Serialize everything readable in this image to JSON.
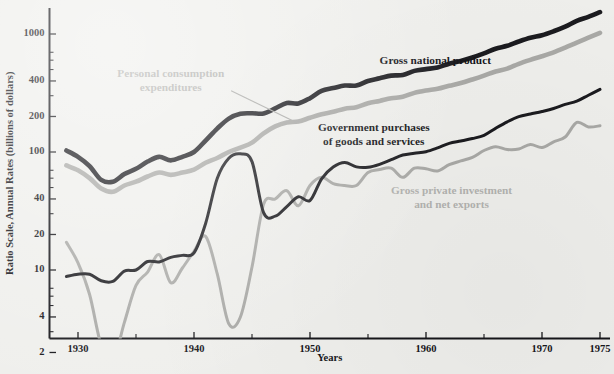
{
  "chart_data": {
    "type": "line",
    "title": "",
    "xlabel": "Years",
    "ylabel": "Ratio Scale, Annual Rates (billions of dollars)",
    "yscale": "log",
    "ylim": [
      2,
      1700
    ],
    "xlim": [
      1929,
      1976
    ],
    "grid": false,
    "legend_position": "inline-annotations",
    "ytick_labels": [
      "1000",
      "400",
      "200",
      "100",
      "40",
      "20",
      "10",
      "4",
      "2"
    ],
    "ytick_values": [
      1000,
      400,
      200,
      100,
      40,
      20,
      10,
      4,
      2
    ],
    "yminor_values": [
      700,
      600,
      500,
      300,
      70,
      60,
      50,
      30,
      7,
      6,
      5,
      3
    ],
    "xtick_labels": [
      "1930",
      "1940",
      "1950",
      "1960",
      "1970",
      "1975"
    ],
    "xtick_values": [
      1930,
      1940,
      1950,
      1960,
      1970,
      1975
    ],
    "xminor_values": [
      1935,
      1945,
      1955,
      1965
    ],
    "colors": {
      "dark_series": "#1b1b1f",
      "gray_series": "#a9a9a6",
      "background": "#efefec",
      "axis": "#16161a",
      "dark_label": "#141418",
      "gray_label": "#b3b3b0"
    },
    "series": [
      {
        "name": "Gross national product",
        "color_key": "dark_series",
        "stroke_width": 4.6,
        "label": {
          "text_lines": [
            "Gross national product"
          ],
          "x": 1956.0,
          "y": 560,
          "anchor": "start"
        },
        "x": [
          1929,
          1930,
          1931,
          1932,
          1933,
          1934,
          1935,
          1936,
          1937,
          1938,
          1939,
          1940,
          1941,
          1942,
          1943,
          1944,
          1945,
          1946,
          1947,
          1948,
          1949,
          1950,
          1951,
          1952,
          1953,
          1954,
          1955,
          1956,
          1957,
          1958,
          1959,
          1960,
          1961,
          1962,
          1963,
          1964,
          1965,
          1966,
          1967,
          1968,
          1969,
          1970,
          1971,
          1972,
          1973,
          1974,
          1975
        ],
        "y": [
          103,
          91,
          76,
          58,
          56,
          65,
          72,
          83,
          91,
          85,
          91,
          100,
          125,
          158,
          192,
          211,
          213,
          212,
          234,
          260,
          258,
          286,
          330,
          348,
          366,
          366,
          400,
          421,
          444,
          449,
          487,
          504,
          521,
          560,
          591,
          632,
          685,
          750,
          794,
          864,
          930,
          977,
          1055,
          1155,
          1294,
          1397,
          1530
        ]
      },
      {
        "name": "Personal consumption expenditures",
        "color_key": "gray_series",
        "stroke_width": 4.6,
        "label": {
          "text_lines": [
            "Personal consumption",
            "expenditures"
          ],
          "x": 1938.0,
          "y": 430,
          "anchor": "middle"
        },
        "leader": {
          "x1": 1943.2,
          "y1": 330,
          "x2": 1948.6,
          "y2": 182
        },
        "x": [
          1929,
          1930,
          1931,
          1932,
          1933,
          1934,
          1935,
          1936,
          1937,
          1938,
          1939,
          1940,
          1941,
          1942,
          1943,
          1944,
          1945,
          1946,
          1947,
          1948,
          1949,
          1950,
          1951,
          1952,
          1953,
          1954,
          1955,
          1956,
          1957,
          1958,
          1959,
          1960,
          1961,
          1962,
          1963,
          1964,
          1965,
          1966,
          1967,
          1968,
          1969,
          1970,
          1971,
          1972,
          1973,
          1974,
          1975
        ],
        "y": [
          77,
          70,
          60,
          49,
          46,
          52,
          56,
          62,
          67,
          64,
          67,
          71,
          81,
          89,
          100,
          109,
          120,
          144,
          165,
          178,
          181,
          195,
          209,
          219,
          233,
          240,
          259,
          271,
          285,
          294,
          317,
          332,
          343,
          364,
          384,
          412,
          444,
          481,
          509,
          559,
          604,
          648,
          700,
          768,
          847,
          932,
          1024
        ]
      },
      {
        "name": "Government purchases of goods and services",
        "color_key": "dark_series",
        "stroke_width": 3.0,
        "label": {
          "text_lines": [
            "Government purchases",
            "of goods and services"
          ],
          "x": 1955.5,
          "y": 150,
          "anchor": "middle"
        },
        "x": [
          1929,
          1930,
          1931,
          1932,
          1933,
          1934,
          1935,
          1936,
          1937,
          1938,
          1939,
          1940,
          1941,
          1942,
          1943,
          1944,
          1945,
          1946,
          1947,
          1948,
          1949,
          1950,
          1951,
          1952,
          1953,
          1954,
          1955,
          1956,
          1957,
          1958,
          1959,
          1960,
          1961,
          1962,
          1963,
          1964,
          1965,
          1966,
          1967,
          1968,
          1969,
          1970,
          1971,
          1972,
          1973,
          1974,
          1975
        ],
        "y": [
          8.8,
          9.2,
          9.2,
          8.1,
          8.0,
          9.8,
          10.0,
          11.8,
          11.7,
          12.8,
          13.3,
          14.0,
          24.8,
          59.6,
          88.6,
          96.5,
          82.9,
          30.6,
          28.6,
          34.5,
          41.8,
          38.8,
          59.3,
          74.7,
          81.6,
          74.8,
          74.2,
          78.6,
          86.1,
          94.2,
          97.6,
          100.6,
          108.3,
          118.2,
          123.8,
          130.0,
          138.4,
          158.7,
          180.1,
          199.6,
          210.0,
          220.5,
          233.7,
          253.1,
          269.5,
          302.7,
          339.0
        ]
      },
      {
        "name": "Gross private investment and net exports",
        "color_key": "gray_series",
        "stroke_width": 3.0,
        "label": {
          "text_lines": [
            "Gross private investment",
            "and net exports"
          ],
          "x": 1962.2,
          "y": 44,
          "anchor": "middle"
        },
        "x": [
          1929,
          1930,
          1931,
          1932,
          1933,
          1934,
          1935,
          1936,
          1937,
          1938,
          1939,
          1940,
          1941,
          1942,
          1943,
          1944,
          1945,
          1946,
          1947,
          1948,
          1949,
          1950,
          1951,
          1952,
          1953,
          1954,
          1955,
          1956,
          1957,
          1958,
          1959,
          1960,
          1961,
          1962,
          1963,
          1964,
          1965,
          1966,
          1967,
          1968,
          1969,
          1970,
          1971,
          1972,
          1973,
          1974,
          1975
        ],
        "y": [
          17.2,
          11.5,
          6.2,
          2.3,
          1.7,
          3.6,
          7.4,
          9.6,
          13.5,
          7.8,
          10.4,
          14.4,
          19.3,
          9.3,
          3.5,
          4.0,
          10.6,
          36.0,
          40.0,
          47.0,
          35.0,
          52.0,
          61.0,
          54.0,
          52.0,
          52.0,
          67.0,
          71.0,
          73.0,
          61.0,
          73.0,
          72.0,
          69.0,
          78.0,
          84.0,
          90.0,
          103.0,
          111.0,
          105.0,
          106.0,
          116.0,
          109.0,
          122.0,
          134.0,
          178.0,
          163.0,
          167.0
        ]
      }
    ]
  }
}
